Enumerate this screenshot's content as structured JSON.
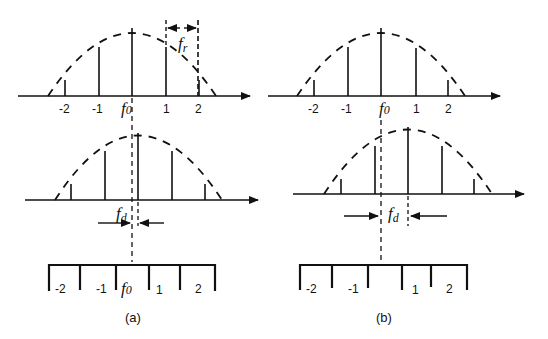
{
  "figure": {
    "panels": [
      {
        "id": "a",
        "caption": "(a)",
        "top_spectrum": {
          "tick_labels": [
            "-2",
            "-1",
            "f",
            "1",
            "2"
          ],
          "center_label": "f",
          "center_sub": "0",
          "spacing_label": "f",
          "spacing_sub": "r"
        },
        "middle_spectrum": {
          "offset_label": "f",
          "offset_sub": "d"
        },
        "filter_bank": {
          "bin_labels": [
            "-2",
            "-1",
            "f",
            "1",
            "2"
          ],
          "center_label": "f",
          "center_sub": "0"
        }
      },
      {
        "id": "b",
        "caption": "(b)",
        "top_spectrum": {
          "tick_labels": [
            "-2",
            "-1",
            "f",
            "1",
            "2"
          ],
          "center_label": "f",
          "center_sub": "0"
        },
        "middle_spectrum": {
          "offset_label": "f",
          "offset_sub": "d"
        },
        "filter_bank": {
          "bin_labels": [
            "-2",
            "-1",
            "1",
            "2"
          ]
        }
      }
    ]
  },
  "colors": {
    "ink": "#111111",
    "background": "#ffffff"
  }
}
